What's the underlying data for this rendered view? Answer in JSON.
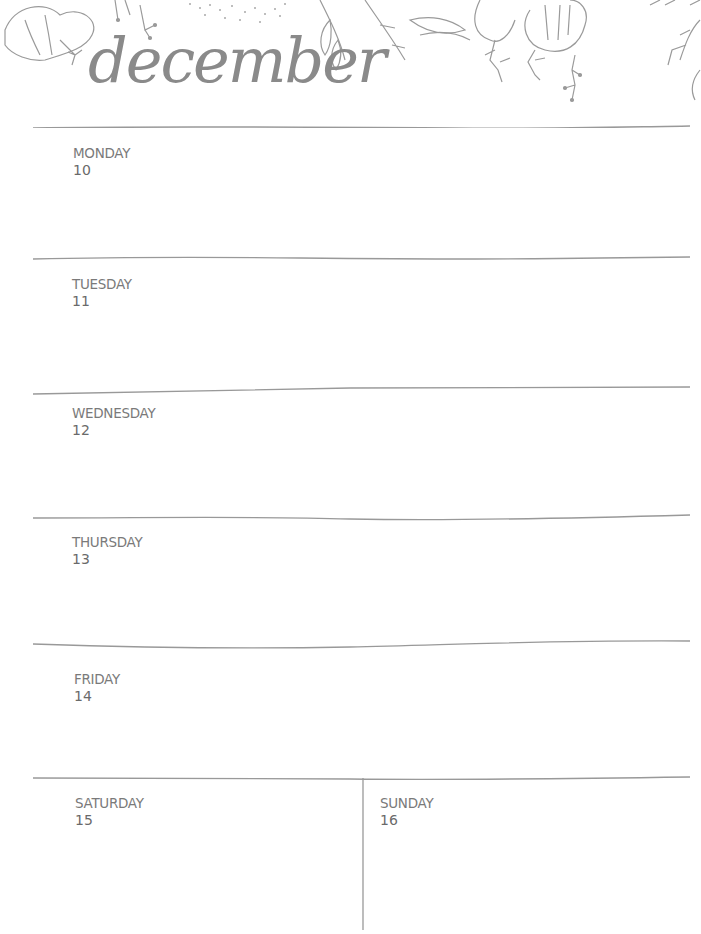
{
  "planner": {
    "month": "december",
    "days": [
      {
        "name": "MONDAY",
        "date": "10"
      },
      {
        "name": "TUESDAY",
        "date": "11"
      },
      {
        "name": "WEDNESDAY",
        "date": "12"
      },
      {
        "name": "THURSDAY",
        "date": "13"
      },
      {
        "name": "FRIDAY",
        "date": "14"
      },
      {
        "name": "SATURDAY",
        "date": "15"
      },
      {
        "name": "SUNDAY",
        "date": "16"
      }
    ]
  },
  "colors": {
    "ink": "#8a8a8a",
    "rule": "#999999",
    "background": "#ffffff"
  }
}
